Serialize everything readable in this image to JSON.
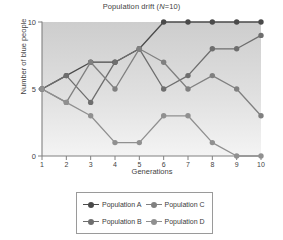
{
  "chart_data": {
    "type": "line",
    "title": "Population drift (N=10)",
    "title_prefix": "Population drift (",
    "title_italic": "N",
    "title_suffix": "=10)",
    "xlabel": "Generations",
    "ylabel": "Number of blue people",
    "x": [
      1,
      2,
      3,
      4,
      5,
      6,
      7,
      8,
      9,
      10
    ],
    "xticklabels": [
      "1",
      "2",
      "3",
      "4",
      "5",
      "6",
      "7",
      "8",
      "9",
      "10"
    ],
    "yticklabels": [
      "0",
      "5",
      "10"
    ],
    "yticks": [
      0,
      5,
      10
    ],
    "xlim": [
      1,
      10
    ],
    "ylim": [
      0,
      10
    ],
    "grid": false,
    "legend_position": "below-center",
    "series": [
      {
        "name": "Population A",
        "color": "#4a4a4a",
        "values": [
          5,
          6,
          7,
          7,
          8,
          10,
          10,
          10,
          10,
          10
        ]
      },
      {
        "name": "Population B",
        "color": "#6e6e6e",
        "values": [
          5,
          6,
          4,
          7,
          8,
          5,
          6,
          8,
          8,
          9
        ]
      },
      {
        "name": "Population C",
        "color": "#808080",
        "values": [
          5,
          4,
          7,
          5,
          8,
          7,
          5,
          6,
          5,
          3
        ]
      },
      {
        "name": "Population D",
        "color": "#909090",
        "values": [
          5,
          4,
          3,
          1,
          1,
          3,
          3,
          1,
          0,
          0
        ]
      }
    ]
  },
  "legend": {
    "entries": [
      {
        "label": "Population A"
      },
      {
        "label": "Population C"
      },
      {
        "label": "Population B"
      },
      {
        "label": "Population D"
      }
    ]
  },
  "axes": {
    "axis_color": "#808080",
    "plot_bg_top": "#cfcfcf",
    "plot_bg_bottom": "#f2f2f2"
  }
}
